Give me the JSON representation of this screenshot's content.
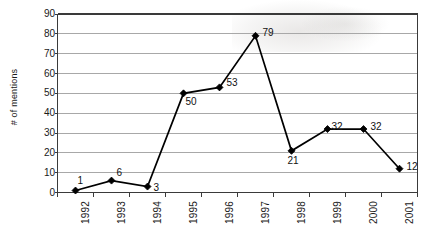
{
  "chart_data": {
    "type": "line",
    "title": "",
    "subtitle": "",
    "xlabel": "",
    "ylabel": "# of mentions",
    "categories": [
      "1992",
      "1993",
      "1994",
      "1995",
      "1996",
      "1997",
      "1998",
      "1999",
      "2000",
      "2001"
    ],
    "values": [
      1,
      6,
      3,
      50,
      53,
      79,
      21,
      32,
      32,
      12
    ],
    "point_labels": [
      "1",
      "6",
      "3",
      "50",
      "53",
      "79",
      "21",
      "32",
      "32",
      "12"
    ],
    "ylim": [
      0,
      90
    ],
    "ytick_labels": [
      "0",
      "10",
      "20",
      "30",
      "40",
      "50",
      "60",
      "70",
      "80",
      "90"
    ],
    "ytick_values": [
      0,
      10,
      20,
      30,
      40,
      50,
      60,
      70,
      80,
      90
    ],
    "grid": "horizontal",
    "legend": "none",
    "marker": "diamond",
    "marker_color": "#000000",
    "line_color": "#000000",
    "grid_color": "#a8a8a8",
    "axis_color": "#3a3a3a",
    "plot_background": "#ffffff",
    "xlabel_rotation": -90,
    "series": [
      {
        "name": "# of mentions",
        "values": [
          1,
          6,
          3,
          50,
          53,
          79,
          21,
          32,
          32,
          12
        ]
      }
    ]
  },
  "figure": {
    "background": "#ffffff"
  }
}
